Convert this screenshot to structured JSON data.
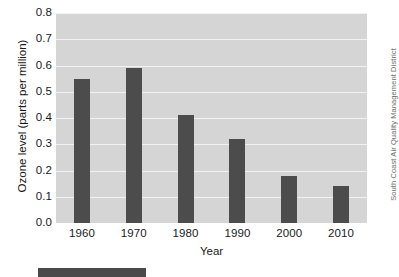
{
  "chart_data": {
    "type": "bar",
    "title": "",
    "subtitle": "",
    "xlabel": "Year",
    "ylabel": "Ozone level (parts per million)",
    "categories": [
      "1960",
      "1970",
      "1980",
      "1990",
      "2000",
      "2010"
    ],
    "values": [
      0.55,
      0.59,
      0.41,
      0.32,
      0.18,
      0.14
    ],
    "series": [
      {
        "name": "Ozone level",
        "values": [
          0.55,
          0.59,
          0.41,
          0.32,
          0.18,
          0.14
        ]
      }
    ],
    "ylim": [
      0.0,
      0.8
    ],
    "ytick_labels": [
      "0.8",
      "0.7",
      "0.6",
      "0.5",
      "0.4",
      "0.3",
      "0.2",
      "0.1",
      "0.0"
    ],
    "ytick_values": [
      0.8,
      0.7,
      0.6,
      0.5,
      0.4,
      0.3,
      0.2,
      0.1,
      0.0
    ],
    "grid": true,
    "grid_orientation": "horizontal",
    "legend": false,
    "legend_position": "none",
    "annotations": [
      "South Coast Air Quality Management District"
    ],
    "colors": {
      "bar": "#4c4c4c",
      "plot_background": "#d5d5d5",
      "gridline": "#f2f2f2",
      "figure_background": "#ffffff",
      "tick_label": "#1a1a1a",
      "credit_text": "#6e6e6e"
    }
  },
  "axes": {
    "y_title": "Ozone level (parts per million)",
    "x_title": "Year"
  },
  "credit": {
    "text": "South Coast Air Quality Management District"
  }
}
